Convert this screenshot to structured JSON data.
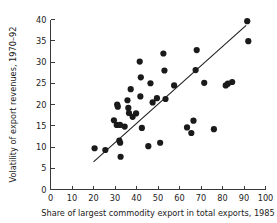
{
  "chart_data": {
    "type": "scatter",
    "title": "",
    "xlabel": "Share of largest commodity export in total exports, 1985",
    "ylabel": "Volatility of export revenues, 1970–92",
    "xlim": [
      0,
      100
    ],
    "ylim": [
      0,
      40
    ],
    "xticks": [
      0,
      10,
      20,
      30,
      40,
      50,
      60,
      70,
      80,
      90,
      100
    ],
    "yticks": [
      0,
      5,
      10,
      15,
      20,
      25,
      30,
      35,
      40
    ],
    "xtick_labels": [
      "0",
      "10",
      "20",
      "30",
      "40",
      "50",
      "60",
      "70",
      "80",
      "90",
      "100"
    ],
    "ytick_labels": [
      "0",
      "5",
      "10",
      "15",
      "20",
      "25",
      "30",
      "35",
      "40"
    ],
    "grid": false,
    "legend": null,
    "marker": {
      "shape": "circle",
      "color": "#1a1a1a",
      "size": 3.1
    },
    "points": [
      [
        20.5,
        9.7
      ],
      [
        25.5,
        9.3
      ],
      [
        29.5,
        16.3
      ],
      [
        31.0,
        20.0
      ],
      [
        31.3,
        19.5
      ],
      [
        30.8,
        15.2
      ],
      [
        32.3,
        15.2
      ],
      [
        32.0,
        11.5
      ],
      [
        32.4,
        11.0
      ],
      [
        32.6,
        7.7
      ],
      [
        34.5,
        14.8
      ],
      [
        35.8,
        21.0
      ],
      [
        36.2,
        19.2
      ],
      [
        36.5,
        18.0
      ],
      [
        37.3,
        23.6
      ],
      [
        38.2,
        17.1
      ],
      [
        39.8,
        17.9
      ],
      [
        41.5,
        30.1
      ],
      [
        42.0,
        26.4
      ],
      [
        41.8,
        21.9
      ],
      [
        42.5,
        14.5
      ],
      [
        45.5,
        10.2
      ],
      [
        46.5,
        25.0
      ],
      [
        47.5,
        20.5
      ],
      [
        49.5,
        21.5
      ],
      [
        51.0,
        11.0
      ],
      [
        52.5,
        32.0
      ],
      [
        53.0,
        28.0
      ],
      [
        53.5,
        21.3
      ],
      [
        57.5,
        24.5
      ],
      [
        63.5,
        14.6
      ],
      [
        65.5,
        13.3
      ],
      [
        66.5,
        16.2
      ],
      [
        67.5,
        28.1
      ],
      [
        68.0,
        32.8
      ],
      [
        71.5,
        25.1
      ],
      [
        76.0,
        14.2
      ],
      [
        81.5,
        24.5
      ],
      [
        82.5,
        24.9
      ],
      [
        84.5,
        25.3
      ],
      [
        91.5,
        39.6
      ],
      [
        92.0,
        34.9
      ]
    ],
    "trendline": {
      "type": "linear-fit",
      "x_start": 20.0,
      "y_start": 6.5,
      "x_end": 91.0,
      "y_end": 38.6,
      "color": "#1a1a1a"
    }
  }
}
